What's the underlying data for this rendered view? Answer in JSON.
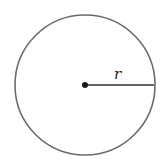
{
  "diagram": {
    "type": "circle-with-radius",
    "circle": {
      "cx": 85,
      "cy": 85,
      "r": 70,
      "stroke": "#6b6b6b",
      "stroke_width": 1.6
    },
    "center_point": {
      "cx": 85,
      "cy": 85,
      "r": 3,
      "fill": "#1a1a1a"
    },
    "radius_line": {
      "x1": 85,
      "y1": 85,
      "x2": 154,
      "y2": 85,
      "stroke": "#333333",
      "stroke_width": 1.6
    },
    "radius_label": "r"
  }
}
